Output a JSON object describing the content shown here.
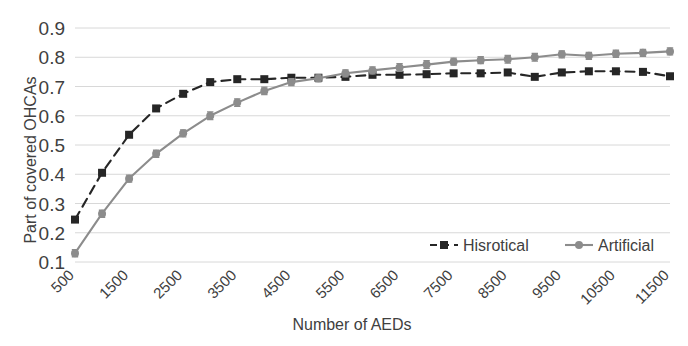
{
  "chart_data": {
    "type": "line",
    "title": "",
    "xlabel": "Number of AEDs",
    "ylabel": "Part of covered OHCAs",
    "xlim": [
      500,
      11500
    ],
    "ylim": [
      0.1,
      0.9
    ],
    "ytick_labels": [
      "0.9",
      "0.8",
      "0.7",
      "0.6",
      "0.5",
      "0.4",
      "0.3",
      "0.2",
      "0.1"
    ],
    "ytick_values": [
      0.9,
      0.8,
      0.7,
      0.6,
      0.5,
      0.4,
      0.3,
      0.2,
      0.1
    ],
    "xtick_labels": [
      "500",
      "1500",
      "2500",
      "3500",
      "4500",
      "5500",
      "6500",
      "7500",
      "8500",
      "9500",
      "10500",
      "11500"
    ],
    "xtick_values": [
      500,
      1500,
      2500,
      3500,
      4500,
      5500,
      6500,
      7500,
      8500,
      9500,
      10500,
      11500
    ],
    "xtick_rotation_deg": 45,
    "grid": "horizontal",
    "legend_position": "inside-bottom-right",
    "x": [
      500,
      1000,
      1500,
      2000,
      2500,
      3000,
      3500,
      4000,
      4500,
      5000,
      5500,
      6000,
      6500,
      7000,
      7500,
      8000,
      8500,
      9000,
      9500,
      10000,
      10500,
      11000,
      11500
    ],
    "series": [
      {
        "name": "Hisrotical",
        "color": "#262626",
        "line_style": "dashed",
        "marker": "square",
        "error_bars": false,
        "values": [
          0.245,
          0.405,
          0.535,
          0.625,
          0.675,
          0.715,
          0.725,
          0.725,
          0.73,
          0.73,
          0.733,
          0.74,
          0.74,
          0.742,
          0.745,
          0.745,
          0.748,
          0.733,
          0.748,
          0.752,
          0.752,
          0.75,
          0.735
        ]
      },
      {
        "name": "Artificial",
        "color": "#8c8c8c",
        "line_style": "solid",
        "marker": "circle",
        "error_bars": true,
        "values": [
          0.13,
          0.265,
          0.385,
          0.47,
          0.54,
          0.6,
          0.645,
          0.685,
          0.715,
          0.728,
          0.745,
          0.755,
          0.765,
          0.775,
          0.785,
          0.79,
          0.793,
          0.8,
          0.81,
          0.805,
          0.812,
          0.815,
          0.82
        ],
        "error": [
          0.012,
          0.012,
          0.012,
          0.012,
          0.012,
          0.013,
          0.013,
          0.013,
          0.012,
          0.012,
          0.012,
          0.012,
          0.013,
          0.013,
          0.012,
          0.012,
          0.013,
          0.013,
          0.012,
          0.012,
          0.012,
          0.012,
          0.012
        ]
      }
    ],
    "legend": [
      {
        "label": "Hisrotical",
        "color": "#262626",
        "marker": "square",
        "line_style": "dashed"
      },
      {
        "label": "Artificial",
        "color": "#8c8c8c",
        "marker": "circle",
        "line_style": "solid"
      }
    ]
  },
  "colors": {
    "historical": "#262626",
    "artificial": "#8c8c8c",
    "gridline": "#d8d8d8",
    "text": "#404040",
    "background": "#ffffff"
  }
}
